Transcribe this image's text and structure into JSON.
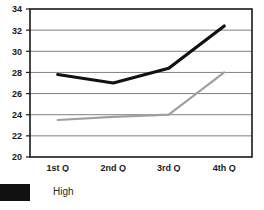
{
  "chart_data": {
    "type": "line",
    "title": "",
    "subtitle": "",
    "xlabel": "",
    "ylabel": "",
    "categories": [
      "1st Q",
      "2nd Q",
      "3rd Q",
      "4th Q"
    ],
    "series": [
      {
        "name": "High",
        "color": "#111111",
        "values": [
          27.8,
          27.0,
          28.4,
          32.4
        ]
      },
      {
        "name": "",
        "color": "#a0a0a0",
        "values": [
          23.5,
          23.8,
          24.0,
          28.0
        ]
      }
    ],
    "ylim": [
      20,
      34
    ],
    "yticks": [
      20,
      22,
      24,
      26,
      28,
      30,
      32,
      34
    ],
    "ytick_labels": [
      "20",
      "22",
      "24",
      "26",
      "28",
      "30",
      "32",
      "34"
    ],
    "grid": "horizontal",
    "legend_position": "bottom-left",
    "plot_frame": true
  },
  "legend": {
    "entries": [
      {
        "label": "High",
        "color": "#111111",
        "swatch": "legend-swatch"
      }
    ]
  }
}
